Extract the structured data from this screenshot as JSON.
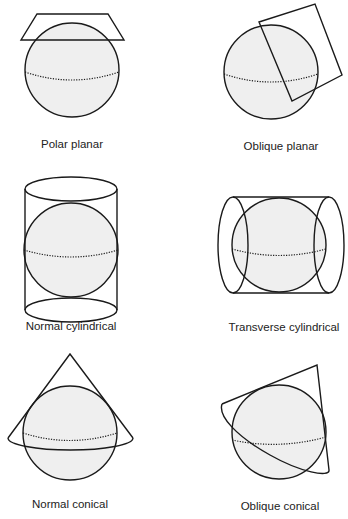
{
  "projections": [
    {
      "id": "polar-planar",
      "label": "Polar planar",
      "surface": "plane",
      "aspect": "polar"
    },
    {
      "id": "oblique-planar",
      "label": "Oblique planar",
      "surface": "plane",
      "aspect": "oblique"
    },
    {
      "id": "normal-cylindrical",
      "label": "Normal cylindrical",
      "surface": "cylinder",
      "aspect": "normal"
    },
    {
      "id": "transverse-cylindrical",
      "label": "Transverse cylindrical",
      "surface": "cylinder",
      "aspect": "transverse"
    },
    {
      "id": "normal-conical",
      "label": "Normal conical",
      "surface": "cone",
      "aspect": "normal"
    },
    {
      "id": "oblique-conical",
      "label": "Oblique conical",
      "surface": "cone",
      "aspect": "oblique"
    }
  ],
  "colors": {
    "stroke": "#1a1a1a",
    "sphere_fill": "#efefef",
    "background": "#ffffff"
  }
}
